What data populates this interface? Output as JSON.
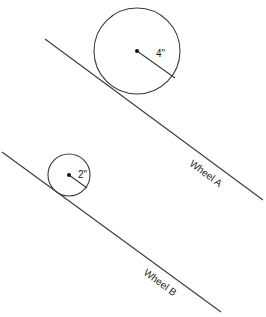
{
  "diagram": {
    "wheel_a": {
      "label": "Wheel A",
      "radius_label": "4\"",
      "circle": {
        "cx": 137,
        "cy": 51,
        "r": 43
      },
      "radius_end": {
        "x": 175,
        "y": 78
      },
      "incline": {
        "x1": 45,
        "y1": 39,
        "x2": 263,
        "y2": 200
      }
    },
    "wheel_b": {
      "label": "Wheel B",
      "radius_label": "2\"",
      "circle": {
        "cx": 69,
        "cy": 175,
        "r": 21
      },
      "radius_end": {
        "x": 87,
        "y": 188
      },
      "incline": {
        "x1": 2,
        "y1": 152,
        "x2": 221,
        "y2": 312
      }
    },
    "colors": {
      "line": "#3a3a3a",
      "background": "#ffffff",
      "text": "#1a1a1a"
    }
  }
}
